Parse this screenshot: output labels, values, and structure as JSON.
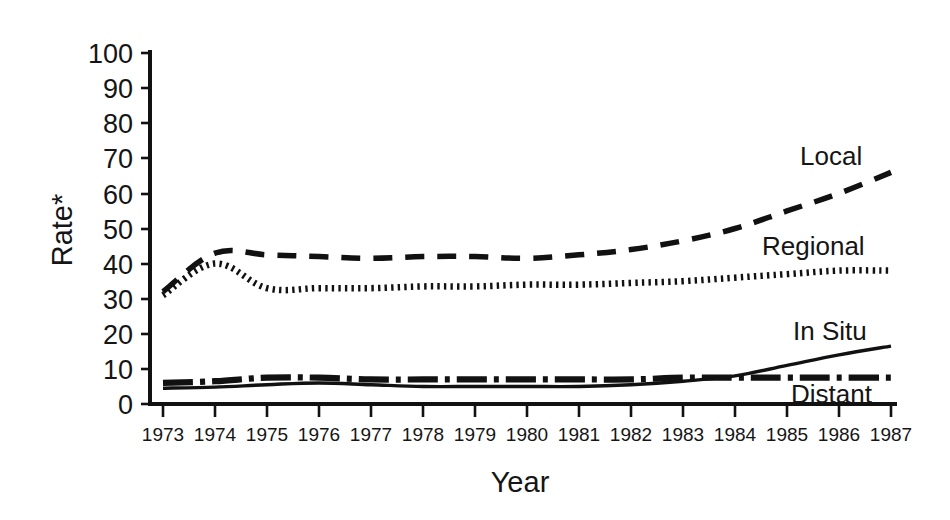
{
  "chart_data": {
    "type": "line",
    "title": "",
    "xlabel": "Year",
    "ylabel": "Rate*",
    "x": [
      1973,
      1974,
      1975,
      1976,
      1977,
      1978,
      1979,
      1980,
      1981,
      1982,
      1983,
      1984,
      1985,
      1986,
      1987
    ],
    "xticklabels": [
      "1973",
      "1974",
      "1975",
      "1976",
      "1977",
      "1978",
      "1979",
      "1980",
      "1981",
      "1982",
      "1983",
      "1984",
      "1985",
      "1986",
      "1987"
    ],
    "yticklabels": [
      "0",
      "10",
      "20",
      "30",
      "40",
      "50",
      "60",
      "70",
      "80",
      "90",
      "100"
    ],
    "yticks": [
      0,
      10,
      20,
      30,
      40,
      50,
      60,
      70,
      80,
      90,
      100
    ],
    "ylim": [
      0,
      100
    ],
    "xlim": [
      1973,
      1987
    ],
    "grid": false,
    "legend": "inline-right-labels",
    "series": [
      {
        "name": "Local",
        "style": "dashed",
        "color": "#111111",
        "values": [
          32,
          43,
          42.5,
          42,
          41.5,
          42,
          42,
          41.5,
          42.5,
          44,
          46.5,
          50,
          55,
          60,
          66
        ]
      },
      {
        "name": "Regional",
        "style": "dotted",
        "color": "#111111",
        "values": [
          31,
          40,
          33,
          33,
          33,
          33.5,
          33.5,
          34,
          34,
          34.5,
          35,
          36,
          37,
          38,
          38
        ]
      },
      {
        "name": "In Situ",
        "style": "solid",
        "color": "#111111",
        "values": [
          4.5,
          4.8,
          5.5,
          6,
          5.5,
          5,
          5,
          5,
          5,
          5.5,
          6.5,
          8,
          11,
          14,
          16.5
        ]
      },
      {
        "name": "Distant",
        "style": "dash-dot",
        "color": "#111111",
        "values": [
          6,
          6.5,
          7.5,
          7.5,
          7,
          7,
          7,
          7,
          7,
          7,
          7.5,
          7.5,
          7.5,
          7.5,
          7.5
        ]
      }
    ]
  },
  "labels": {
    "y_axis_title": "Rate*",
    "x_axis_title": "Year",
    "series_local": "Local",
    "series_regional": "Regional",
    "series_insitu": "In Situ",
    "series_distant": "Distant",
    "y_0": "0",
    "y_10": "10",
    "y_20": "20",
    "y_30": "30",
    "y_40": "40",
    "y_50": "50",
    "y_60": "60",
    "y_70": "70",
    "y_80": "80",
    "y_90": "90",
    "y_100": "100",
    "x_1973": "1973",
    "x_1974": "1974",
    "x_1975": "1975",
    "x_1976": "1976",
    "x_1977": "1977",
    "x_1978": "1978",
    "x_1979": "1979",
    "x_1980": "1980",
    "x_1981": "1981",
    "x_1982": "1982",
    "x_1983": "1983",
    "x_1984": "1984",
    "x_1985": "1985",
    "x_1986": "1986",
    "x_1987": "1987"
  }
}
